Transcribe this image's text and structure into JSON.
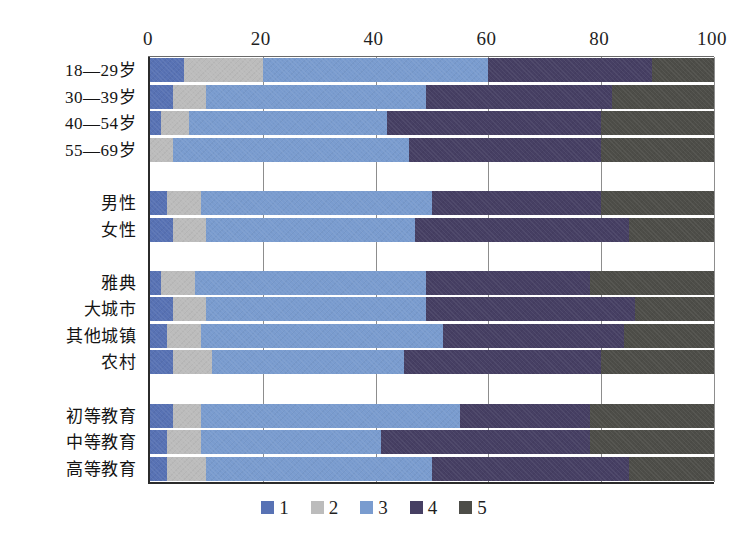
{
  "chart_data": {
    "type": "bar",
    "subtype": "horizontal-stacked-100",
    "title": "",
    "xlabel": "",
    "ylabel": "",
    "xlim": [
      0,
      100
    ],
    "xticks": [
      0,
      20,
      40,
      60,
      80,
      100
    ],
    "grid": true,
    "legend_position": "bottom-center",
    "stack_total": 100,
    "categories": [
      "18—29岁",
      "30—39岁",
      "40—54岁",
      "55—69岁",
      "",
      "男性",
      "女性",
      "",
      "雅典",
      "大城市",
      "其他城镇",
      "农村",
      "",
      "初等教育",
      "中等教育",
      "高等教育"
    ],
    "series": [
      {
        "name": "1",
        "color": "#5872b4",
        "values": [
          6,
          4,
          2,
          0,
          null,
          3,
          4,
          null,
          2,
          4,
          3,
          4,
          null,
          4,
          3,
          3
        ]
      },
      {
        "name": "2",
        "color": "#bcbcbc",
        "values": [
          14,
          6,
          5,
          4,
          null,
          6,
          6,
          null,
          6,
          6,
          6,
          7,
          null,
          5,
          6,
          7
        ]
      },
      {
        "name": "3",
        "color": "#7a9ccf",
        "values": [
          40,
          39,
          35,
          42,
          null,
          41,
          37,
          null,
          41,
          39,
          43,
          34,
          null,
          46,
          32,
          40
        ]
      },
      {
        "name": "4",
        "color": "#463f63",
        "values": [
          29,
          33,
          38,
          34,
          null,
          30,
          38,
          null,
          29,
          37,
          32,
          35,
          null,
          23,
          37,
          35
        ]
      },
      {
        "name": "5",
        "color": "#4d4d48",
        "values": [
          11,
          18,
          20,
          20,
          null,
          20,
          15,
          null,
          22,
          14,
          16,
          20,
          null,
          22,
          22,
          15
        ]
      }
    ],
    "cumulative_boundaries": [
      [
        6,
        20,
        60,
        89,
        100
      ],
      [
        4,
        10,
        49,
        82,
        100
      ],
      [
        2,
        7,
        42,
        80,
        100
      ],
      [
        0,
        4,
        46,
        80,
        100
      ],
      null,
      [
        3,
        9,
        50,
        80,
        100
      ],
      [
        4,
        10,
        47,
        85,
        100
      ],
      null,
      [
        2,
        8,
        49,
        78,
        100
      ],
      [
        4,
        10,
        49,
        86,
        100
      ],
      [
        3,
        9,
        52,
        84,
        100
      ],
      [
        4,
        11,
        45,
        80,
        100
      ],
      null,
      [
        4,
        9,
        55,
        78,
        100
      ],
      [
        3,
        9,
        41,
        78,
        100
      ],
      [
        3,
        10,
        50,
        85,
        100
      ]
    ]
  },
  "legend": {
    "items": [
      {
        "label": "1",
        "color": "#5872b4"
      },
      {
        "label": "2",
        "color": "#bcbcbc"
      },
      {
        "label": "3",
        "color": "#7a9ccf"
      },
      {
        "label": "4",
        "color": "#463f63"
      },
      {
        "label": "5",
        "color": "#4d4d48"
      }
    ]
  },
  "axis": {
    "x_tick_labels": [
      "0",
      "20",
      "40",
      "60",
      "80",
      "100"
    ]
  }
}
